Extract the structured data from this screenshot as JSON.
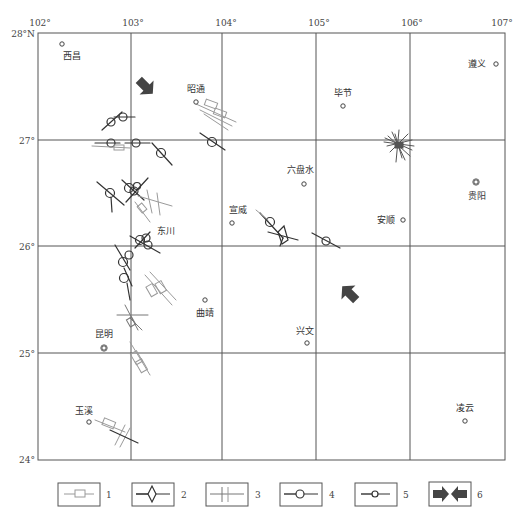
{
  "map": {
    "lon_labels": [
      {
        "text": "102°",
        "x": 40
      },
      {
        "text": "103°",
        "x": 133
      },
      {
        "text": "104°",
        "x": 226
      },
      {
        "text": "105°",
        "x": 319
      },
      {
        "text": "106°",
        "x": 412
      },
      {
        "text": "107°",
        "x": 502
      }
    ],
    "lat_labels": [
      {
        "text": "28°N",
        "y": 34
      },
      {
        "text": "27°",
        "y": 141
      },
      {
        "text": "26°",
        "y": 247
      },
      {
        "text": "25°",
        "y": 354
      },
      {
        "text": "24°",
        "y": 460
      }
    ],
    "cities": [
      {
        "name": "西昌",
        "dot_x": 62,
        "dot_y": 44,
        "label_x": 63,
        "label_y": 59,
        "anchor": "start",
        "double": false
      },
      {
        "name": "昭通",
        "dot_x": 196,
        "dot_y": 102,
        "label_x": 196,
        "label_y": 92,
        "anchor": "middle",
        "double": false
      },
      {
        "name": "毕节",
        "dot_x": 343,
        "dot_y": 106,
        "label_x": 343,
        "label_y": 96,
        "anchor": "middle",
        "double": false
      },
      {
        "name": "遵义",
        "dot_x": 496,
        "dot_y": 64,
        "label_x": 486,
        "label_y": 67,
        "anchor": "end",
        "double": false
      },
      {
        "name": "六盘水",
        "dot_x": 304,
        "dot_y": 184,
        "label_x": 300,
        "label_y": 173,
        "anchor": "middle",
        "double": false
      },
      {
        "name": "贵阳",
        "dot_x": 476,
        "dot_y": 182,
        "label_x": 477,
        "label_y": 199,
        "anchor": "middle",
        "double": true
      },
      {
        "name": "宣威",
        "dot_x": 232,
        "dot_y": 223,
        "label_x": 238,
        "label_y": 213,
        "anchor": "middle",
        "double": false
      },
      {
        "name": "安顺",
        "dot_x": 403,
        "dot_y": 220,
        "label_x": 395,
        "label_y": 223,
        "anchor": "end",
        "double": false
      },
      {
        "name": "东川",
        "dot_x": 0,
        "dot_y": 0,
        "label_x": 166,
        "label_y": 234,
        "anchor": "middle",
        "double": false,
        "no_dot": true
      },
      {
        "name": "曲靖",
        "dot_x": 205,
        "dot_y": 300,
        "label_x": 205,
        "label_y": 316,
        "anchor": "middle",
        "double": false
      },
      {
        "name": "兴文",
        "dot_x": 307,
        "dot_y": 343,
        "label_x": 305,
        "label_y": 334,
        "anchor": "middle",
        "double": false
      },
      {
        "name": "昆明",
        "dot_x": 104,
        "dot_y": 348,
        "label_x": 104,
        "label_y": 337,
        "anchor": "middle",
        "double": true
      },
      {
        "name": "玉溪",
        "dot_x": 89,
        "dot_y": 422,
        "label_x": 84,
        "label_y": 414,
        "anchor": "middle",
        "double": false
      },
      {
        "name": "凌云",
        "dot_x": 465,
        "dot_y": 421,
        "label_x": 465,
        "label_y": 411,
        "anchor": "middle",
        "double": false
      }
    ],
    "stress_arrows": [
      {
        "id": "arrow-northwest",
        "x": 145,
        "y": 86,
        "angle": 45
      },
      {
        "id": "arrow-southeast",
        "x": 350,
        "y": 294,
        "angle": -135
      }
    ]
  },
  "legend": {
    "items": [
      {
        "num": "1",
        "symbol": "rectangle-bar"
      },
      {
        "num": "2",
        "symbol": "diamond-bar"
      },
      {
        "num": "3",
        "symbol": "double-cross-bar"
      },
      {
        "num": "4",
        "symbol": "large-circle-bar"
      },
      {
        "num": "5",
        "symbol": "small-circle-bar"
      },
      {
        "num": "6",
        "symbol": "converging-arrows"
      }
    ]
  },
  "colors": {
    "grid": "#555555",
    "dark_symbol": "#333333",
    "light_symbol": "#9a9a9a",
    "arrow": "#444444"
  }
}
